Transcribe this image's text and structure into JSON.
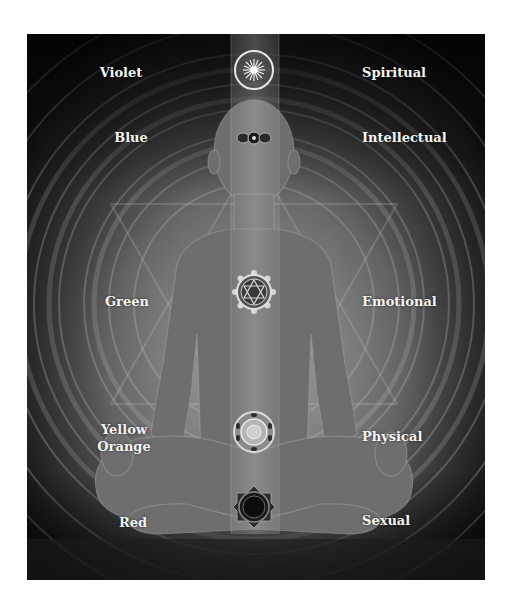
{
  "diagram": {
    "title": "",
    "style": "grayscale meditation figure with chakra symbols",
    "chakras": [
      {
        "name": "crown",
        "color_label": "Violet",
        "aspect_label": "Spiritual",
        "symbol": "radiant-sun-circle-icon"
      },
      {
        "name": "third-eye",
        "color_label": "Blue",
        "aspect_label": "Intellectual",
        "symbol": "three-dot-eye-icon"
      },
      {
        "name": "heart",
        "color_label": "Green",
        "aspect_label": "Emotional",
        "symbol": "hexagram-lotus-icon"
      },
      {
        "name": "solar-plexus",
        "color_label": "Yellow\nOrange",
        "color_label_lines": [
          "Yellow",
          "Orange"
        ],
        "aspect_label": "Physical",
        "symbol": "lotus-mandala-icon"
      },
      {
        "name": "root",
        "color_label": "Red",
        "aspect_label": "Sexual",
        "symbol": "dark-lotus-ring-icon"
      }
    ],
    "signature": "Akhanandar",
    "signature_mark": "©",
    "colors": {
      "background_dark": "#111111",
      "figure_gray": "#6e6e6e",
      "glow_light": "#d8d8d8",
      "label_text": "#f4f4f4",
      "page": "#ffffff"
    }
  }
}
